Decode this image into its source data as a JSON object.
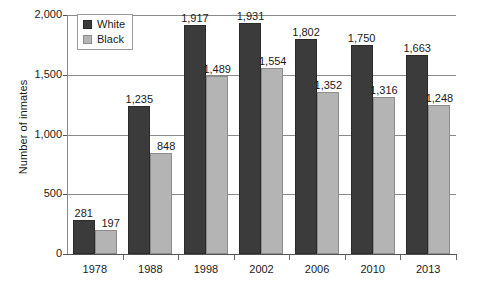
{
  "chart_data": {
    "type": "bar",
    "title": "",
    "xlabel": "",
    "ylabel": "Number of inmates",
    "categories": [
      "1978",
      "1988",
      "1998",
      "2002",
      "2006",
      "2010",
      "2013"
    ],
    "series": [
      {
        "name": "White",
        "color": "#3b3b3b",
        "values": [
          281,
          1235,
          1917,
          1931,
          1802,
          1750,
          1663
        ],
        "labels": [
          "281",
          "1,235",
          "1,917",
          "1,931",
          "1,802",
          "1,750",
          "1,663"
        ]
      },
      {
        "name": "Black",
        "color": "#b4b4b4",
        "values": [
          197,
          848,
          1489,
          1554,
          1352,
          1316,
          1248
        ],
        "labels": [
          "197",
          "848",
          "1,489",
          "1,554",
          "1,352",
          "1,316",
          "1,248"
        ]
      }
    ],
    "ylim": [
      0,
      2000
    ],
    "yticks": [
      0,
      500,
      1000,
      1500,
      2000
    ],
    "ytick_labels": [
      "0",
      "500",
      "1,000",
      "1,500",
      "2,000"
    ],
    "grid": true,
    "legend_position": "top-left"
  },
  "legend": {
    "items": [
      {
        "label": "White",
        "swatch": "white-series-swatch"
      },
      {
        "label": "Black",
        "swatch": "black-series-swatch"
      }
    ]
  },
  "axes": {
    "y_title": "Number of inmates"
  }
}
